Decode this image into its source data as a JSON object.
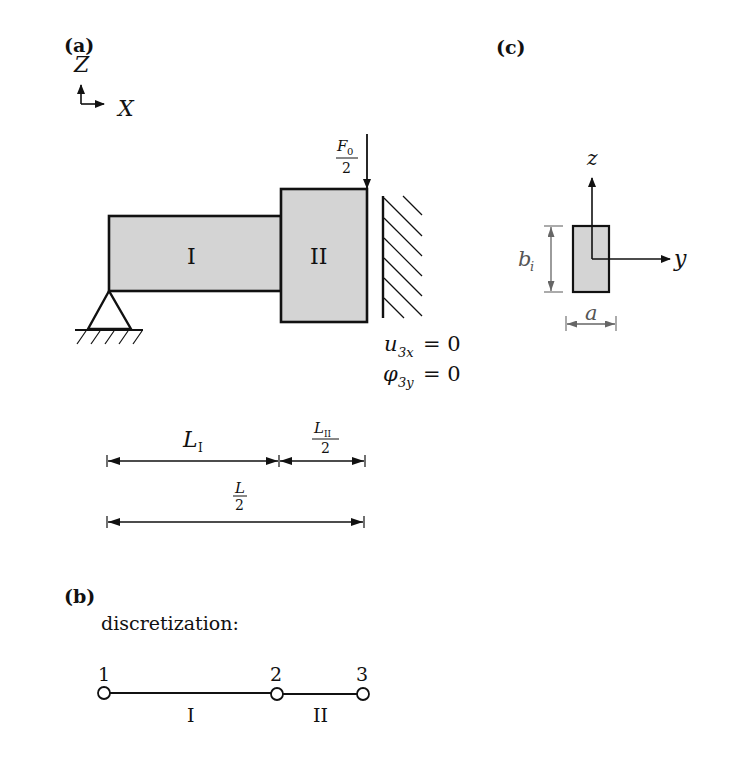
{
  "panels": {
    "a": {
      "label": "(a)",
      "axes": {
        "z": "Z",
        "x": "X"
      },
      "segments": [
        {
          "label": "I"
        },
        {
          "label": "II"
        }
      ],
      "load": {
        "num": "F",
        "num_sub": "0",
        "den": "2"
      },
      "boundary": {
        "line1_var": "u",
        "line1_sub": "3x",
        "line1_rhs": "= 0",
        "line2_var": "φ",
        "line2_sub": "3y",
        "line2_rhs": "= 0"
      },
      "dimensions": {
        "L1": {
          "main": "L",
          "sub": "I"
        },
        "L2": {
          "num": "L",
          "num_sub": "II",
          "den": "2"
        },
        "L": {
          "num": "L",
          "den": "2"
        }
      }
    },
    "b": {
      "label": "(b)",
      "caption": "discretization:",
      "nodes": [
        "1",
        "2",
        "3"
      ],
      "elements": [
        "I",
        "II"
      ]
    },
    "c": {
      "label": "(c)",
      "axes": {
        "z": "z",
        "y": "y"
      },
      "height_label": {
        "main": "b",
        "sub": "i"
      },
      "width_label": "a"
    }
  },
  "colors": {
    "fill": "#d4d4d4",
    "stroke": "#111111",
    "dim_gray": "#666666"
  }
}
